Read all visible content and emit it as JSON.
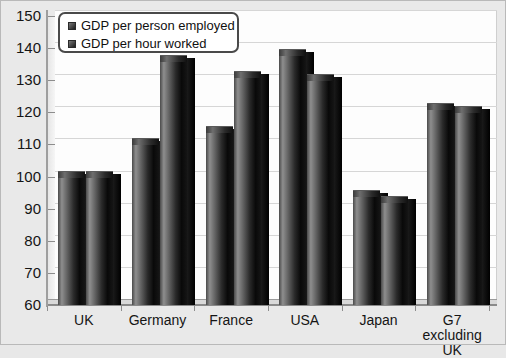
{
  "chart_data": {
    "type": "bar",
    "title": "",
    "xlabel": "",
    "ylabel": "",
    "ylim": [
      60,
      150
    ],
    "ytick_step": 10,
    "yticks": [
      150,
      140,
      130,
      120,
      110,
      100,
      90,
      80,
      70,
      60
    ],
    "grid": true,
    "legend_position": "top-left",
    "categories": [
      "UK",
      "Germany",
      "France",
      "USA",
      "Japan",
      "G7 excluding UK"
    ],
    "series": [
      {
        "name": "GDP per person employed",
        "values": [
          100,
          110,
          114,
          138,
          94,
          121
        ]
      },
      {
        "name": "GDP per hour worked",
        "values": [
          100,
          136,
          131,
          130,
          92,
          120
        ]
      }
    ]
  },
  "legend": {
    "items": [
      {
        "label": "GDP per person employed",
        "swatch": "legend-swatch-icon"
      },
      {
        "label": "GDP per hour worked",
        "swatch": "legend-swatch-icon"
      }
    ]
  },
  "colors": {
    "background": "#e9e9e9",
    "plot_background": "#fdfdfd",
    "gridline": "#d6d6d6",
    "axis": "#9e9e9e",
    "bar_dark": "#0a0a0a",
    "bar_light": "#8e8e8e",
    "text": "#151515",
    "legend_border": "#4a4a4a"
  }
}
